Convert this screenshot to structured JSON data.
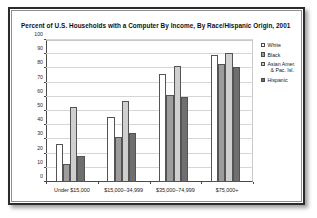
{
  "chart_data": {
    "type": "bar",
    "title": "Percent of U.S. Households with a Computer By Income, By Race/Hispanic Origin, 2001",
    "xlabel": "",
    "ylabel": "",
    "ylim": [
      0,
      100
    ],
    "ytick_step": 10,
    "yticks": [
      100,
      90,
      80,
      70,
      60,
      50,
      40,
      30,
      20,
      10,
      0
    ],
    "grid": true,
    "legend_position": "right",
    "categories": [
      "Under $15,000",
      "$15,000–34,999",
      "$35,000–74,999",
      "$75,000+"
    ],
    "series": [
      {
        "name": "White",
        "color": "#ffffff",
        "values": [
          27,
          46,
          76,
          89.5
        ]
      },
      {
        "name": "Black",
        "color": "#9c9c9c",
        "values": [
          13,
          31.5,
          61,
          83
        ]
      },
      {
        "name": "Asian Amer. & Pac. Isl.",
        "color": "#cfcfcf",
        "values": [
          52.5,
          57,
          81.5,
          91
        ]
      },
      {
        "name": "Hispanic",
        "color": "#6f6f6f",
        "values": [
          18,
          34.5,
          60,
          81
        ]
      }
    ]
  },
  "legend": {
    "items": [
      {
        "line1": "White",
        "line2": ""
      },
      {
        "line1": "Black",
        "line2": ""
      },
      {
        "line1": "Asian Amer.",
        "line2": "& Pac. Isl."
      },
      {
        "line1": "Hispanic",
        "line2": ""
      }
    ]
  }
}
